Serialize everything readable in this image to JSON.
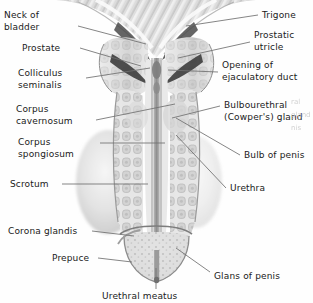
{
  "figure": {
    "modality": "greyscale anatomical illustration",
    "background_color": "#fefefe",
    "label_color": "#1a1a1a",
    "leader_color": "#6f6f6f"
  },
  "labels_left": [
    {
      "id": "neck-of-bladder",
      "lines": [
        "Neck of",
        "bladder"
      ],
      "x": 4,
      "y": 10,
      "anchor_x": 78,
      "anchor_y": 26,
      "target_x": 146,
      "target_y": 44
    },
    {
      "id": "prostate",
      "lines": [
        "Prostate"
      ],
      "x": 22,
      "y": 43,
      "anchor_x": 80,
      "anchor_y": 48,
      "target_x": 141,
      "target_y": 66
    },
    {
      "id": "colliculus-seminalis",
      "lines": [
        "Colliculus",
        "seminalis"
      ],
      "x": 18,
      "y": 68,
      "anchor_x": 86,
      "anchor_y": 78,
      "target_x": 150,
      "target_y": 68
    },
    {
      "id": "corpus-cavernosum",
      "lines": [
        "Corpus",
        "cavernosum"
      ],
      "x": 16,
      "y": 104,
      "anchor_x": 96,
      "anchor_y": 120,
      "target_x": 175,
      "target_y": 104
    },
    {
      "id": "corpus-spongiosum",
      "lines": [
        "Corpus",
        "spongiosum"
      ],
      "x": 18,
      "y": 137,
      "anchor_x": 100,
      "anchor_y": 143,
      "target_x": 165,
      "target_y": 143
    },
    {
      "id": "scrotum",
      "lines": [
        "Scrotum"
      ],
      "x": 10,
      "y": 179,
      "anchor_x": 62,
      "anchor_y": 184,
      "target_x": 148,
      "target_y": 184
    },
    {
      "id": "corona-glandis",
      "lines": [
        "Corona glandis"
      ],
      "x": 8,
      "y": 226,
      "anchor_x": 92,
      "anchor_y": 231,
      "target_x": 134,
      "target_y": 236
    },
    {
      "id": "prepuce",
      "lines": [
        "Prepuce"
      ],
      "x": 52,
      "y": 253,
      "anchor_x": 98,
      "anchor_y": 258,
      "target_x": 132,
      "target_y": 262
    }
  ],
  "labels_right": [
    {
      "id": "trigone",
      "lines": [
        "Trigone"
      ],
      "x": 262,
      "y": 10,
      "anchor_x": 258,
      "anchor_y": 15,
      "target_x": 186,
      "target_y": 26
    },
    {
      "id": "prostatic-utricle",
      "lines": [
        "Prostatic",
        "utricle"
      ],
      "x": 254,
      "y": 30,
      "anchor_x": 250,
      "anchor_y": 42,
      "target_x": 178,
      "target_y": 58
    },
    {
      "id": "opening-of-ejaculatory-duct",
      "lines": [
        "Opening of",
        "ejaculatory duct"
      ],
      "x": 222,
      "y": 60,
      "anchor_x": 218,
      "anchor_y": 72,
      "target_x": 168,
      "target_y": 70
    },
    {
      "id": "bulbourethral-cowpers-gland",
      "lines": [
        "Bulbourethral",
        "(Cowper's) gland"
      ],
      "x": 224,
      "y": 100,
      "anchor_x": 220,
      "anchor_y": 106,
      "target_x": 172,
      "target_y": 118
    },
    {
      "id": "bulb-of-penis",
      "lines": [
        "Bulb of penis"
      ],
      "x": 244,
      "y": 150,
      "anchor_x": 240,
      "anchor_y": 155,
      "target_x": 176,
      "target_y": 118
    },
    {
      "id": "urethra",
      "lines": [
        "Urethra"
      ],
      "x": 230,
      "y": 183,
      "anchor_x": 226,
      "anchor_y": 188,
      "target_x": 176,
      "target_y": 135
    },
    {
      "id": "glans-of-penis",
      "lines": [
        "Glans of penis"
      ],
      "x": 214,
      "y": 271,
      "anchor_x": 210,
      "anchor_y": 272,
      "target_x": 176,
      "target_y": 248
    }
  ],
  "labels_bottom": [
    {
      "id": "urethral-meatus",
      "lines": [
        "Urethral meatus"
      ],
      "x": 102,
      "y": 291,
      "anchor_x": 156,
      "anchor_y": 289,
      "target_x": 156,
      "target_y": 268
    }
  ],
  "bleed_text": "ral\ngland\n\nnis"
}
